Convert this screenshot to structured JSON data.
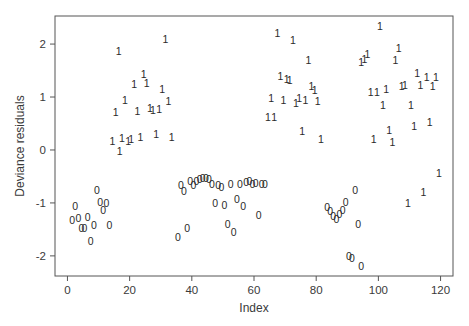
{
  "chart_data": {
    "type": "scatter",
    "title": "",
    "xlabel": "Index",
    "ylabel": "Deviance residuals",
    "xlim": [
      -4,
      124
    ],
    "ylim": [
      -2.38,
      2.53
    ],
    "xticks": [
      0,
      20,
      40,
      60,
      80,
      100,
      120
    ],
    "yticks": [
      -2,
      -1,
      0,
      1,
      2
    ],
    "grid": false,
    "legend": null,
    "marker_style": "points drawn as text glyphs equal to observed response (0 or 1)",
    "series": [
      {
        "name": "0",
        "glyph": "0",
        "points": [
          [
            1.5,
            -1.32
          ],
          [
            2.5,
            -1.05
          ],
          [
            3.5,
            -1.28
          ],
          [
            4.5,
            -1.48
          ],
          [
            5.5,
            -1.48
          ],
          [
            6.5,
            -1.26
          ],
          [
            7.5,
            -1.72
          ],
          [
            8.5,
            -1.42
          ],
          [
            9.5,
            -0.76
          ],
          [
            10.5,
            -0.98
          ],
          [
            11.5,
            -1.13
          ],
          [
            12.5,
            -1.0
          ],
          [
            13.5,
            -1.42
          ],
          [
            35.5,
            -1.65
          ],
          [
            36.5,
            -0.67
          ],
          [
            37.5,
            -0.77
          ],
          [
            38.5,
            -1.47
          ],
          [
            39.5,
            -0.58
          ],
          [
            40.5,
            -0.66
          ],
          [
            41.5,
            -0.58
          ],
          [
            42.5,
            -0.54
          ],
          [
            43.5,
            -0.53
          ],
          [
            44.5,
            -0.52
          ],
          [
            45.5,
            -0.55
          ],
          [
            46.5,
            -0.65
          ],
          [
            47.5,
            -1.0
          ],
          [
            48.5,
            -0.67
          ],
          [
            49.5,
            -0.7
          ],
          [
            50.5,
            -1.04
          ],
          [
            51.5,
            -1.4
          ],
          [
            52.5,
            -0.64
          ],
          [
            53.5,
            -1.55
          ],
          [
            54.5,
            -0.92
          ],
          [
            55.5,
            -0.64
          ],
          [
            56.5,
            -1.06
          ],
          [
            57.5,
            -0.6
          ],
          [
            58.5,
            -0.58
          ],
          [
            59.5,
            -0.65
          ],
          [
            60.5,
            -0.63
          ],
          [
            61.5,
            -1.22
          ],
          [
            62.5,
            -0.64
          ],
          [
            63.5,
            -0.64
          ],
          [
            83.5,
            -1.07
          ],
          [
            84.5,
            -1.16
          ],
          [
            85.5,
            -1.25
          ],
          [
            86.5,
            -1.3
          ],
          [
            87.5,
            -1.2
          ],
          [
            88.5,
            -1.13
          ],
          [
            89.5,
            -0.98
          ],
          [
            90.5,
            -2.0
          ],
          [
            91.5,
            -2.04
          ],
          [
            92.5,
            -0.75
          ],
          [
            93.5,
            -1.4
          ],
          [
            94.5,
            -2.2
          ]
        ]
      },
      {
        "name": "1",
        "glyph": "1",
        "points": [
          [
            14.5,
            0.17
          ],
          [
            15.5,
            0.71
          ],
          [
            16.5,
            1.86
          ],
          [
            16.8,
            -0.01
          ],
          [
            17.5,
            0.22
          ],
          [
            18.5,
            0.94
          ],
          [
            19.5,
            0.17
          ],
          [
            20.5,
            0.2
          ],
          [
            21.5,
            1.24
          ],
          [
            22.5,
            0.73
          ],
          [
            23.5,
            0.25
          ],
          [
            24.5,
            1.44
          ],
          [
            25.5,
            1.27
          ],
          [
            26.5,
            0.8
          ],
          [
            27.5,
            0.76
          ],
          [
            28.5,
            0.3
          ],
          [
            29.5,
            0.77
          ],
          [
            30.5,
            1.16
          ],
          [
            31.5,
            2.09
          ],
          [
            32.5,
            0.92
          ],
          [
            33.5,
            0.25
          ],
          [
            64.5,
            0.62
          ],
          [
            65.5,
            0.99
          ],
          [
            66.5,
            0.62
          ],
          [
            67.5,
            2.21
          ],
          [
            68.5,
            1.4
          ],
          [
            69.5,
            0.95
          ],
          [
            70.5,
            1.34
          ],
          [
            71.5,
            1.33
          ],
          [
            72.5,
            2.07
          ],
          [
            73.5,
            0.88
          ],
          [
            74.5,
            0.98
          ],
          [
            75.5,
            0.35
          ],
          [
            76.5,
            0.94
          ],
          [
            77.5,
            1.7
          ],
          [
            78.5,
            1.2
          ],
          [
            79.5,
            1.14
          ],
          [
            80.5,
            0.92
          ],
          [
            81.5,
            0.2
          ],
          [
            94.5,
            1.66
          ],
          [
            95.5,
            1.71
          ],
          [
            96.5,
            1.82
          ],
          [
            97.5,
            1.1
          ],
          [
            98.5,
            0.2
          ],
          [
            99.5,
            1.1
          ],
          [
            100.5,
            2.34
          ],
          [
            101.5,
            0.85
          ],
          [
            102.5,
            1.16
          ],
          [
            103.5,
            0.37
          ],
          [
            104.5,
            0.15
          ],
          [
            105.5,
            1.7
          ],
          [
            106.5,
            1.92
          ],
          [
            107.5,
            1.2
          ],
          [
            108.5,
            1.23
          ],
          [
            109.5,
            -1.0
          ],
          [
            110.5,
            0.85
          ],
          [
            111.5,
            0.45
          ],
          [
            112.5,
            1.46
          ],
          [
            113.5,
            1.23
          ],
          [
            114.5,
            -0.8
          ],
          [
            115.5,
            1.37
          ],
          [
            116.5,
            0.52
          ],
          [
            117.5,
            1.2
          ],
          [
            118.5,
            1.37
          ],
          [
            119.5,
            -0.43
          ]
        ]
      }
    ]
  }
}
